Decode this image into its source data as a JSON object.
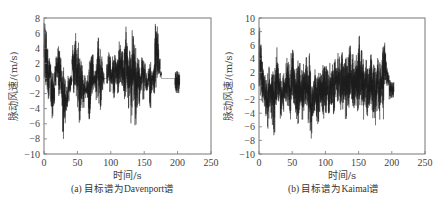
{
  "chart_data": [
    {
      "type": "line",
      "title": "",
      "caption": "(a) 目标谱为Davenport谱",
      "xlabel": "时间/s",
      "ylabel": "脉动风速/(m/s)",
      "xlim": [
        0,
        250
      ],
      "ylim": [
        -10,
        8
      ],
      "xticks": [
        0,
        50,
        100,
        150,
        200,
        250
      ],
      "yticks": [
        -10,
        -8,
        -6,
        -4,
        -2,
        0,
        2,
        4,
        6,
        8
      ],
      "grid": false,
      "legend": null,
      "series": [
        {
          "name": "Davenport fluctuating wind speed",
          "x": [
            0,
            2,
            4,
            6,
            8,
            10,
            12,
            14,
            16,
            18,
            20,
            22,
            24,
            26,
            28,
            30,
            32,
            34,
            36,
            38,
            40,
            42,
            44,
            46,
            48,
            50,
            52,
            54,
            56,
            58,
            60,
            62,
            64,
            66,
            68,
            70,
            72,
            74,
            76,
            78,
            80,
            82,
            84,
            86,
            88,
            90,
            92,
            94,
            96,
            98,
            100,
            102,
            104,
            106,
            108,
            110,
            112,
            114,
            116,
            118,
            120,
            122,
            124,
            126,
            128,
            130,
            132,
            134,
            136,
            138,
            140,
            142,
            144,
            146,
            148,
            150,
            152,
            154,
            156,
            158,
            160,
            162,
            164,
            166,
            168,
            170,
            172,
            174,
            176,
            178,
            180,
            182,
            184,
            186,
            188,
            190,
            192,
            194,
            196,
            198,
            200,
            202,
            204
          ],
          "upper": [
            7.5,
            6.5,
            4,
            2.5,
            3.5,
            2,
            1,
            0,
            2,
            3,
            4.5,
            4,
            3,
            2,
            1.5,
            0.5,
            -2,
            -1,
            0.5,
            0.5,
            0.5,
            4.5,
            4,
            6.5,
            4.5,
            5,
            3,
            2.5,
            2,
            0.5,
            0.5,
            -1,
            1,
            2,
            2.5,
            3,
            3.5,
            1,
            2,
            4,
            5.5,
            5.5,
            4,
            3,
            1,
            0,
            0,
            2,
            3.5,
            3,
            1.5,
            3,
            2.5,
            3.5,
            3,
            4,
            5,
            4.5,
            4,
            3,
            4.5,
            8,
            5,
            3.5,
            4,
            4.5,
            6.5,
            6,
            4.5,
            2.5,
            3,
            2.5,
            1.5,
            3,
            3.5,
            2,
            1,
            0.5,
            1.5,
            2.5,
            1,
            1,
            2.5,
            7.5,
            7,
            6,
            3,
            1,
            0,
            0,
            0,
            0,
            0,
            0,
            0,
            0,
            0,
            0,
            0,
            0,
            0,
            0,
            0
          ],
          "lower": [
            0,
            -1,
            -2,
            -3,
            -1,
            -4,
            -5.5,
            -4,
            -1,
            0,
            -1,
            -3,
            -2,
            -4,
            -8.5,
            -6,
            -4.5,
            -4,
            -3,
            -2,
            -1,
            0,
            -2,
            -1,
            -3,
            -4,
            -6,
            -5.5,
            -3,
            -4,
            -3,
            -2,
            -3,
            -6,
            -5.5,
            -3,
            -2,
            -1,
            -2,
            -3,
            -3,
            -4,
            -5,
            -2,
            -1,
            0,
            0,
            -1,
            -1,
            -2,
            -1,
            -2,
            -3,
            -1,
            -1,
            -2,
            -1,
            -1,
            -1,
            -2,
            -3,
            -2,
            -3,
            -4,
            -3,
            -6,
            -3,
            -4,
            -6.5,
            -4,
            -2,
            -4.5,
            -2,
            -1,
            -3,
            -1,
            -2,
            -2,
            -1,
            -4.5,
            -2,
            -1,
            -2,
            -3,
            0,
            0,
            0,
            0,
            0,
            0,
            0,
            0,
            0,
            0,
            0,
            0,
            0,
            0,
            0,
            0,
            0,
            0,
            0
          ]
        }
      ],
      "line_color": "#1a1a1a"
    },
    {
      "type": "line",
      "title": "",
      "caption": "(b) 目标谱为Kaimal谱",
      "xlabel": "时间/s",
      "ylabel": "脉动风速/(m/s)",
      "xlim": [
        0,
        250
      ],
      "ylim": [
        -10,
        10
      ],
      "xticks": [
        0,
        50,
        100,
        150,
        200,
        250
      ],
      "yticks": [
        -10,
        -8,
        -6,
        -4,
        -2,
        0,
        2,
        4,
        6,
        8,
        10
      ],
      "grid": false,
      "legend": null,
      "series": [
        {
          "name": "Kaimal fluctuating wind speed",
          "x": [
            0,
            2,
            4,
            6,
            8,
            10,
            12,
            14,
            16,
            18,
            20,
            22,
            24,
            26,
            28,
            30,
            32,
            34,
            36,
            38,
            40,
            42,
            44,
            46,
            48,
            50,
            52,
            54,
            56,
            58,
            60,
            62,
            64,
            66,
            68,
            70,
            72,
            74,
            76,
            78,
            80,
            82,
            84,
            86,
            88,
            90,
            92,
            94,
            96,
            98,
            100,
            102,
            104,
            106,
            108,
            110,
            112,
            114,
            116,
            118,
            120,
            122,
            124,
            126,
            128,
            130,
            132,
            134,
            136,
            138,
            140,
            142,
            144,
            146,
            148,
            150,
            152,
            154,
            156,
            158,
            160,
            162,
            164,
            166,
            168,
            170,
            172,
            174,
            176,
            178,
            180,
            182,
            184,
            186,
            188,
            190,
            192,
            194,
            196,
            198,
            200,
            202,
            204
          ],
          "upper": [
            9,
            8,
            5,
            3,
            2,
            1.5,
            2,
            3.5,
            2,
            2.5,
            3,
            2,
            4.5,
            6,
            4,
            2,
            2,
            0,
            2,
            1,
            3.5,
            5.5,
            5,
            3,
            5.5,
            6,
            4,
            3,
            4,
            4.5,
            3.5,
            2,
            2.5,
            4,
            3,
            4.5,
            3,
            4.5,
            5,
            1,
            0,
            1,
            2.5,
            1.5,
            2,
            3,
            2,
            2,
            4,
            3,
            3,
            2.5,
            2,
            3.5,
            3,
            3.5,
            4.5,
            4,
            3,
            5,
            4.5,
            4,
            5,
            3,
            4,
            4.5,
            4,
            5,
            7.5,
            4,
            5,
            3,
            4,
            5,
            6,
            7.5,
            5.5,
            6,
            4,
            3,
            5,
            3,
            3.5,
            4,
            5,
            3,
            4.5,
            3,
            2.5,
            4.5,
            3,
            3.5,
            4,
            7,
            6.5,
            5,
            3,
            2,
            0,
            0,
            0,
            0,
            0
          ],
          "lower": [
            -1,
            -2,
            -3,
            -2,
            -4,
            -6,
            -7,
            -5,
            -3,
            -5,
            -6,
            -7.5,
            -5,
            -4,
            -3,
            -2,
            -5,
            -3,
            -4,
            -2,
            -3,
            -3,
            -4,
            -5,
            -3,
            -2,
            -3,
            -4,
            -5,
            -6,
            -4,
            -3,
            -5,
            -4,
            -3,
            -4,
            -4.5,
            -6,
            -7,
            -8,
            -5,
            -4,
            -3,
            -5.5,
            -6,
            -4,
            -3,
            -4,
            -5,
            -3,
            -4,
            -3,
            -5.5,
            -4,
            -3,
            -3,
            -5,
            -2,
            -1,
            -3,
            -2,
            -4.5,
            -3,
            -4,
            -3,
            -5,
            -3,
            -4.5,
            -2,
            -3,
            -4,
            -4,
            -3,
            -3,
            -4.5,
            -3,
            -2,
            -3,
            -5,
            -3,
            -4,
            -5.5,
            -4,
            -3,
            -4,
            -5,
            -4,
            -6.5,
            -4,
            -3,
            -5,
            -3,
            -3,
            -6,
            0,
            0,
            0,
            0,
            0,
            0,
            0,
            0,
            0
          ]
        }
      ],
      "line_color": "#1a1a1a"
    }
  ],
  "panels": {
    "a": {
      "caption": "(a) 目标谱为Davenport谱",
      "xlabel": "时间/s",
      "ylabel": "脉动风速/(m/s)"
    },
    "b": {
      "caption": "(b) 目标谱为Kaimal谱",
      "xlabel": "时间/s",
      "ylabel": "脉动风速/(m/s)"
    }
  }
}
